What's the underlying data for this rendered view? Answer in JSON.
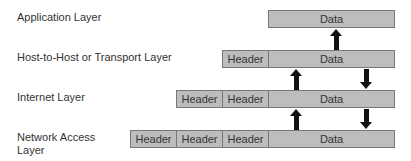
{
  "layers": [
    {
      "label": "Application Layer",
      "headers": [],
      "data": "Data"
    },
    {
      "label": "Host-to-Host or Transport Layer",
      "headers": [
        "Header"
      ],
      "data": "Data"
    },
    {
      "label": "Internet Layer",
      "headers": [
        "Header",
        "Header"
      ],
      "data": "Data"
    },
    {
      "label_line1": "Network Access",
      "label_line2": "Layer",
      "headers": [
        "Header",
        "Header",
        "Header"
      ],
      "data": "Data"
    }
  ],
  "colors": {
    "box_fill": "#bdbdbd",
    "box_border": "#777777",
    "arrow": "#111111",
    "text": "#333333"
  }
}
